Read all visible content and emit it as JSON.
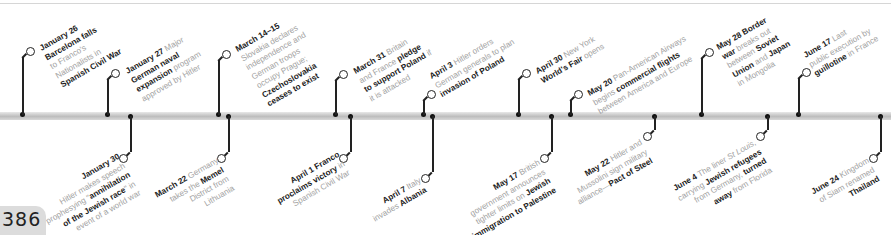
{
  "page_number": "386",
  "timeline": {
    "year": "1939",
    "colors": {
      "bar": "#c8c8c8",
      "stem": "#222222",
      "bold_text": "#1a1a1a",
      "light_text": "#a3a3a3"
    },
    "above": [
      {
        "date": "January 26",
        "lines": [
          [
            "Barcelona falls"
          ],
          [
            "to Franco's"
          ],
          [
            "Nationalists in"
          ],
          [
            "Spanish Civil War"
          ]
        ],
        "bold_lines": [
          0,
          3
        ]
      },
      {
        "date": "January 27",
        "text_html": "Major German naval expansion program approved by Hitler"
      },
      {
        "date": "March 14–15",
        "text_html": "Slovakia declares independence and German troops occupy Prague; Czechoslovakia ceases to exist"
      },
      {
        "date": "March 31",
        "text_html": "Britain and France pledge to support Poland if it is attacked"
      },
      {
        "date": "April 3",
        "text_html": "Hitler orders German generals to plan invasion of Poland"
      },
      {
        "date": "April 30",
        "text_html": "New York World's Fair opens"
      },
      {
        "date": "May 20",
        "text_html": "Pan-American Airways begins commercial flights between America and Europe"
      },
      {
        "date": "May 28",
        "text_html": "Border war breaks out between Soviet Union and Japan in Mongolia"
      },
      {
        "date": "June 17",
        "text_html": "Last public execution by guillotine in France"
      }
    ],
    "below": [
      {
        "date": "January 30",
        "text_html": "Hitler makes speech prophesying \"annihilation of the Jewish race\" in event of a world war"
      },
      {
        "date": "March 22",
        "text_html": "Germany takes the Memel District from Lithuania"
      },
      {
        "date": "April 1",
        "text_html": "Franco proclaims victory in Spanish Civil War"
      },
      {
        "date": "April 7",
        "text_html": "Italy invades Albania"
      },
      {
        "date": "May 17",
        "text_html": "British government announces tighter limits on Jewish immigration to Palestine"
      },
      {
        "date": "May 22",
        "text_html": "Hitler and Mussolini sign military alliance—Pact of Steel"
      },
      {
        "date": "June 4",
        "text_html": "The liner St Louis, carrying Jewish refugees from Germany, turned away from Florida"
      },
      {
        "date": "June 24",
        "text_html": "Kingdom of Siam renamed Thailand"
      }
    ]
  },
  "labels": {
    "jan26": [
      "January 26",
      "Barcelona falls",
      "to Franco's",
      "Nationalists in",
      "Spanish Civil War"
    ],
    "jan27": [
      "January 27",
      " Major",
      "German naval",
      "expansion",
      " program",
      "approved by Hitler"
    ],
    "mar14": [
      "March 14–15",
      "Slovakia declares",
      "independence and",
      "German troops",
      "occupy Prague;",
      "Czechoslovakia",
      "ceases to exist"
    ],
    "mar31": [
      "March 31",
      " Britain",
      "and France ",
      "pledge",
      "to support Poland",
      " if",
      "it is attacked"
    ],
    "apr3": [
      "April 3",
      " Hitler orders",
      "German generals to plan",
      "invasion of Poland"
    ],
    "apr30": [
      "April 30",
      " New York",
      "World's Fair",
      " opens"
    ],
    "may20": [
      "May 20",
      " Pan-American Airways",
      "begins ",
      "commercial flights",
      "between America and Europe"
    ],
    "may28": [
      "May 28 Border",
      "war",
      " breaks out",
      "between ",
      "Soviet",
      "Union",
      " and ",
      "Japan",
      "in Mongolia"
    ],
    "jun17": [
      "June 17",
      " Last",
      "public execution by",
      "guillotine",
      " in France"
    ],
    "jan30": [
      "January 30",
      "Hitler makes speech",
      "prophesying \"",
      "annihilation",
      "of the Jewish race",
      "\" in",
      "event of a world war"
    ],
    "mar22": [
      "March 22",
      " Germany",
      "takes the ",
      "Memel",
      "District from",
      "Lithuania"
    ],
    "apr1": [
      "April 1 Franco",
      "proclaims victory",
      " in",
      "Spanish Civil War"
    ],
    "apr7": [
      "April 7",
      " Italy",
      "invades ",
      "Albania"
    ],
    "may17": [
      "May 17",
      " British",
      "government announces",
      "tighter limits on ",
      "Jewish",
      "immigration to Palestine"
    ],
    "may22": [
      "May 22",
      " Hitler and",
      "Mussolini sign military",
      "alliance—",
      "Pact of Steel"
    ],
    "jun4": [
      "June 4",
      " The liner ",
      "St Louis,",
      "carrying ",
      "Jewish refugees",
      "from Germany, ",
      "turned",
      "away",
      " from Florida"
    ],
    "jun24": [
      "June 24",
      " Kingdom",
      "of Siam renamed",
      "Thailand"
    ]
  }
}
